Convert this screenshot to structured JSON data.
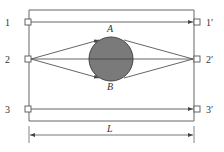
{
  "diagram": {
    "colors": {
      "line": "#555555",
      "circle_fill": "#7a7a7a",
      "circle_stroke": "#444444",
      "background": "#ffffff"
    },
    "frame": {
      "left": 29,
      "right": 194,
      "top": 10,
      "bottom": 121
    },
    "transmitters": [
      {
        "id": "1",
        "label": "1",
        "y": 22
      },
      {
        "id": "2",
        "label": "2",
        "y": 59
      },
      {
        "id": "3",
        "label": "3",
        "y": 109
      }
    ],
    "receivers": [
      {
        "id": "1p",
        "label": "1′",
        "y": 22
      },
      {
        "id": "2p",
        "label": "2′",
        "y": 59
      },
      {
        "id": "3p",
        "label": "3′",
        "y": 109
      }
    ],
    "object": {
      "shape": "circle",
      "cx": 111,
      "cy": 59,
      "r": 22
    },
    "points": {
      "A": {
        "label": "A"
      },
      "B": {
        "label": "B"
      }
    },
    "dimension": {
      "label": "L",
      "y": 135
    }
  }
}
